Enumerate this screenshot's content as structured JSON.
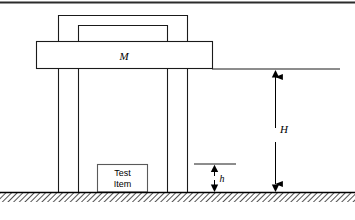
{
  "figure": {
    "name": "drop-shock-test-machine-schematic",
    "type": "engineering-schematic",
    "background_color": "#ffffff",
    "line_color": "#000000",
    "hidden_line_color": "#ffffff",
    "top_rule_color": "#2b2b2b"
  },
  "labels": {
    "hammer_mass": "M",
    "drop_height": "H",
    "anvil_clearance": "h",
    "test_item_line1": "Test",
    "test_item_line2": "Item"
  },
  "parts": {
    "top_crosshead": {
      "label": "top-crosshead-beam",
      "x1": 58,
      "y1": 15,
      "x2": 188,
      "y2": 15
    },
    "inner_crossbeam": {
      "label": "inner-crossbeam",
      "x1": 78,
      "y1": 25,
      "x2": 168,
      "y2": 25
    },
    "guide_columns": {
      "label": "guide-columns",
      "x_positions": [
        58,
        78,
        168,
        188
      ],
      "y_top": 15,
      "y_bottom": 192
    },
    "hammer_block": {
      "label": "hammer-mass-block",
      "x": 36,
      "y": 41,
      "width": 176,
      "height": 28
    },
    "test_item_block": {
      "label": "test-item-block",
      "x": 97,
      "y": 164,
      "width": 50,
      "height": 28
    },
    "ground": {
      "label": "ground-hatched-baseline",
      "y": 192,
      "hatch_height": 9,
      "hatch_angle_deg": 45,
      "hatch_spacing": 4
    },
    "reference_line_H_top": {
      "label": "reference-line-drop-height-top",
      "x1": 212,
      "y1": 69,
      "x2": 340,
      "y2": 69
    },
    "reference_line_h_top": {
      "label": "reference-line-anvil-clearance-top",
      "x1": 194,
      "y1": 164,
      "x2": 236,
      "y2": 164
    },
    "dimension_H": {
      "label": "dimension-arrow-H",
      "x": 275,
      "y_top": 69,
      "y_bottom": 192
    },
    "dimension_h": {
      "label": "dimension-arrow-h",
      "x": 214,
      "y_top": 164,
      "y_bottom": 192
    }
  },
  "frame": {
    "top_rule": {
      "x1": 0,
      "y1": 2,
      "x2": 355,
      "y2": 2,
      "thickness": 2
    }
  }
}
